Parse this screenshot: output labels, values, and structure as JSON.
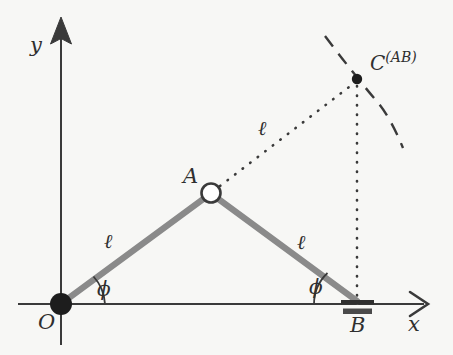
{
  "figure": {
    "background_color": "#f7f7f5",
    "link_color": "#8a8a8a",
    "ink_color": "#2f2f2f",
    "axes": {
      "x_label": "x",
      "y_label": "y",
      "origin_label": "O",
      "x_axis_y": 304,
      "y_axis_x": 61
    },
    "points": {
      "O": {
        "label": "O",
        "x": 61,
        "y": 304,
        "marker": "filled-circle"
      },
      "A": {
        "label": "A",
        "x": 211,
        "y": 193,
        "marker": "open-circle"
      },
      "B": {
        "label": "B",
        "x": 357,
        "y": 303,
        "marker": "slider-support"
      },
      "C": {
        "label": "C",
        "superscript": "(AB)",
        "x": 357,
        "y": 79,
        "marker": "small-filled-dot"
      }
    },
    "links": [
      {
        "name": "link-OA",
        "from": "O",
        "to": "A",
        "style": "solid-thick-gray",
        "length_label": "ℓ"
      },
      {
        "name": "link-AB",
        "from": "A",
        "to": "B",
        "style": "solid-thick-gray",
        "length_label": "ℓ"
      },
      {
        "name": "line-AC",
        "from": "A",
        "to": "C",
        "style": "dotted",
        "length_label": "ℓ"
      },
      {
        "name": "line-CB",
        "from": "C",
        "to": "B",
        "style": "dotted",
        "length_label": ""
      }
    ],
    "arc": {
      "name": "coupler-curve",
      "style": "dashed",
      "through": "C"
    },
    "angles": [
      {
        "name": "angle-at-O",
        "label": "ϕ",
        "vertex": "O"
      },
      {
        "name": "angle-at-B",
        "label": "ϕ",
        "vertex": "B"
      }
    ],
    "length_labels": {
      "ell_OA": "ℓ",
      "ell_AB": "ℓ",
      "ell_AC": "ℓ"
    },
    "c_label_base": "C",
    "c_label_sup": "(AB)"
  }
}
